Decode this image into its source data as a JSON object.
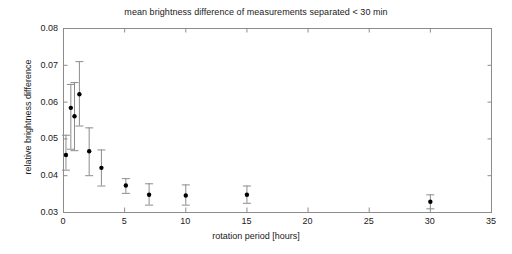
{
  "chart_data": {
    "type": "scatter",
    "title": "mean brightness difference of measurements separated < 30 min",
    "xlabel": "rotation period [hours]",
    "ylabel": "relative brightness difference",
    "xlim": [
      0,
      35
    ],
    "ylim": [
      0.03,
      0.08
    ],
    "xticks": [
      0,
      5,
      10,
      15,
      20,
      25,
      30,
      35
    ],
    "xticklabels": [
      "0",
      "5",
      "10",
      "15",
      "20",
      "25",
      "30",
      "35"
    ],
    "yticks": [
      0.03,
      0.04,
      0.05,
      0.06,
      0.07,
      0.08
    ],
    "yticklabels": [
      "0.03",
      "0.04",
      "0.05",
      "0.06",
      "0.07",
      "0.08"
    ],
    "grid": false,
    "legend": null,
    "marker": "filled-circle",
    "marker_color": "#000000",
    "errorbar_color": "#8c8c8c",
    "axes_color": "#8c8c8c",
    "points": [
      {
        "x": 0.2,
        "y": 0.0455,
        "yerr_low": 0.0415,
        "yerr_high": 0.051
      },
      {
        "x": 0.6,
        "y": 0.0583,
        "yerr_low": 0.0472,
        "yerr_high": 0.0648
      },
      {
        "x": 0.9,
        "y": 0.056,
        "yerr_low": 0.0468,
        "yerr_high": 0.0653
      },
      {
        "x": 1.3,
        "y": 0.062,
        "yerr_low": 0.0535,
        "yerr_high": 0.071
      },
      {
        "x": 2.1,
        "y": 0.0465,
        "yerr_low": 0.04,
        "yerr_high": 0.053
      },
      {
        "x": 3.1,
        "y": 0.042,
        "yerr_low": 0.0372,
        "yerr_high": 0.047
      },
      {
        "x": 5.1,
        "y": 0.0372,
        "yerr_low": 0.0352,
        "yerr_high": 0.0392
      },
      {
        "x": 7.0,
        "y": 0.0347,
        "yerr_low": 0.032,
        "yerr_high": 0.0378
      },
      {
        "x": 10.0,
        "y": 0.0345,
        "yerr_low": 0.032,
        "yerr_high": 0.0375
      },
      {
        "x": 15.0,
        "y": 0.0347,
        "yerr_low": 0.0325,
        "yerr_high": 0.0372
      },
      {
        "x": 30.0,
        "y": 0.0328,
        "yerr_low": 0.031,
        "yerr_high": 0.0348
      }
    ]
  },
  "geometry": {
    "plot_left": 63,
    "plot_right": 491,
    "plot_top": 28,
    "plot_bottom": 212
  }
}
